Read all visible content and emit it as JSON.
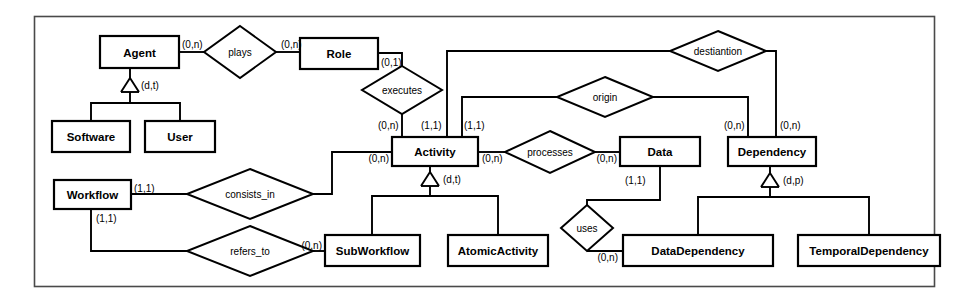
{
  "diagram": {
    "frame_color": "#4a4a4a",
    "line_color": "#000000",
    "background": "#ffffff",
    "entities": [
      {
        "id": "agent",
        "label": "Agent",
        "x": 100,
        "y": 36,
        "w": 79,
        "h": 32
      },
      {
        "id": "role",
        "label": "Role",
        "x": 300,
        "y": 38,
        "w": 78,
        "h": 31
      },
      {
        "id": "software",
        "label": "Software",
        "x": 52,
        "y": 121,
        "w": 78,
        "h": 31
      },
      {
        "id": "user",
        "label": "User",
        "x": 145,
        "y": 121,
        "w": 70,
        "h": 31
      },
      {
        "id": "activity",
        "label": "Activity",
        "x": 392,
        "y": 137,
        "w": 86,
        "h": 29
      },
      {
        "id": "data",
        "label": "Data",
        "x": 620,
        "y": 137,
        "w": 80,
        "h": 29
      },
      {
        "id": "dependency",
        "label": "Dependency",
        "x": 728,
        "y": 137,
        "w": 88,
        "h": 29
      },
      {
        "id": "workflow",
        "label": "Workflow",
        "x": 54,
        "y": 180,
        "w": 77,
        "h": 29
      },
      {
        "id": "subworkflow",
        "label": "SubWorkflow",
        "x": 325,
        "y": 235,
        "w": 95,
        "h": 31
      },
      {
        "id": "atomicactivity",
        "label": "AtomicActivity",
        "x": 448,
        "y": 235,
        "w": 100,
        "h": 31
      },
      {
        "id": "datadependency",
        "label": "DataDependency",
        "x": 623,
        "y": 235,
        "w": 150,
        "h": 31
      },
      {
        "id": "temporaldependency",
        "label": "TemporalDependency",
        "x": 798,
        "y": 235,
        "w": 142,
        "h": 31
      }
    ],
    "relationships": [
      {
        "id": "plays",
        "label": "plays",
        "cx": 240,
        "cy": 52,
        "rx": 36,
        "ry": 26
      },
      {
        "id": "executes",
        "label": "executes",
        "cx": 402,
        "cy": 90,
        "rx": 40,
        "ry": 24
      },
      {
        "id": "destiantion",
        "label": "destiantion",
        "cx": 718,
        "cy": 51,
        "rx": 48,
        "ry": 20
      },
      {
        "id": "origin",
        "label": "origin",
        "cx": 605,
        "cy": 97,
        "rx": 48,
        "ry": 20
      },
      {
        "id": "processes",
        "label": "processes",
        "cx": 550,
        "cy": 152,
        "rx": 45,
        "ry": 21
      },
      {
        "id": "consists_in",
        "label": "consists_in",
        "cx": 250,
        "cy": 194,
        "rx": 63,
        "ry": 25
      },
      {
        "id": "refers_to",
        "label": "refers_to",
        "cx": 250,
        "cy": 251,
        "rx": 63,
        "ry": 25
      },
      {
        "id": "uses",
        "label": "uses",
        "cx": 587,
        "cy": 228,
        "rx": 26,
        "ry": 23
      }
    ],
    "cardinalities": [
      {
        "id": "agent-plays",
        "text": "(0,n)",
        "x": 182,
        "y": 44,
        "anchor": "start"
      },
      {
        "id": "plays-role",
        "text": "(0,n)",
        "x": 281,
        "y": 44,
        "anchor": "start"
      },
      {
        "id": "role-executes",
        "text": "(0,1)",
        "x": 381,
        "y": 62,
        "anchor": "start"
      },
      {
        "id": "executes-activity",
        "text": "(0,n)",
        "x": 378,
        "y": 125,
        "anchor": "start"
      },
      {
        "id": "activity-destination",
        "text": "(1,1)",
        "x": 421,
        "y": 125,
        "anchor": "start"
      },
      {
        "id": "activity-origin",
        "text": "(1,1)",
        "x": 464,
        "y": 125,
        "anchor": "start"
      },
      {
        "id": "dependency-origin",
        "text": "(0,n)",
        "x": 724,
        "y": 125,
        "anchor": "start"
      },
      {
        "id": "dependency-dest",
        "text": "(0,n)",
        "x": 780,
        "y": 125,
        "anchor": "start"
      },
      {
        "id": "activity-consists",
        "text": "(0,n)",
        "x": 389,
        "y": 158,
        "anchor": "end"
      },
      {
        "id": "activity-processes",
        "text": "(0,n)",
        "x": 482,
        "y": 158,
        "anchor": "start"
      },
      {
        "id": "processes-data",
        "text": "(0,n)",
        "x": 617,
        "y": 158,
        "anchor": "end"
      },
      {
        "id": "data-uses",
        "text": "(1,1)",
        "x": 625,
        "y": 180,
        "anchor": "start"
      },
      {
        "id": "uses-datadep",
        "text": "(0,n)",
        "x": 618,
        "y": 257,
        "anchor": "end"
      },
      {
        "id": "workflow-consists",
        "text": "(1,1)",
        "x": 134,
        "y": 188,
        "anchor": "start"
      },
      {
        "id": "workflow-refers",
        "text": "(1,1)",
        "x": 96,
        "y": 218,
        "anchor": "start"
      },
      {
        "id": "refers-subworkflow",
        "text": "(0,n)",
        "x": 322,
        "y": 245,
        "anchor": "end"
      }
    ],
    "isa_labels": [
      {
        "id": "agent-isa",
        "text": "(d,t)",
        "x": 133,
        "y": 85
      },
      {
        "id": "activity-isa",
        "text": "(d,t)",
        "x": 440,
        "y": 179
      },
      {
        "id": "dependency-isa",
        "text": "(d,p)",
        "x": 780,
        "y": 180
      }
    ],
    "entity_note": "Boxes are entity types; diamonds are relationship types; triangles denote ISA generalization hierarchies with (disjoint, total) or (disjoint, partial) annotations."
  }
}
